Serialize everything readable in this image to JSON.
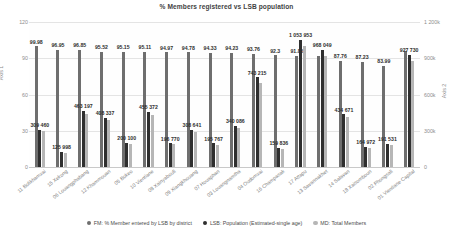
{
  "chart": {
    "title": "% Members registered vs LSB population",
    "y1_title": "Axis 1",
    "y2_title": "Axis 2",
    "y1_ticks": [
      "0",
      "30",
      "60",
      "90",
      "120"
    ],
    "y2_ticks": [
      "0",
      "300k",
      "600k",
      "900k",
      "1 200k"
    ]
  },
  "legend": {
    "items": [
      {
        "key": "fm",
        "label": "FM: % Member entered by LSB by district",
        "color": "#6e6e6e"
      },
      {
        "key": "lsb",
        "label": "LSB: Population (Estimated-single age)",
        "color": "#2f2f2f"
      },
      {
        "key": "md",
        "label": "MD: Total Members",
        "color": "#b6b6b6"
      }
    ]
  },
  "chart_data": {
    "type": "bar",
    "title": "% Members registered vs LSB population",
    "xlabel": "",
    "ylabel": "Axis 1",
    "y2label": "Axis 2",
    "ylim": [
      0,
      120
    ],
    "y2lim": [
      0,
      1200000
    ],
    "grid": true,
    "legend_position": "bottom",
    "categories": [
      "11 Bolikhamxai",
      "15 Xekong",
      "06 Louangphabang",
      "12 Khammouan",
      "05 Bokeo",
      "10 Vientiane",
      "08 Xainyabouli",
      "09 Xiangkhouang",
      "07 Houaphan",
      "03 Louangnamtha",
      "04 Oudomxai",
      "16 Champasak",
      "17 Attapu",
      "13 Savannakhet",
      "14 Salavan",
      "18 Xaisomboun",
      "02 Phongsali",
      "01 Vientiane Capital"
    ],
    "series": [
      {
        "name": "FM: % Member entered by LSB by district",
        "axis": "y1",
        "color": "#6e6e6e",
        "values": [
          99.98,
          96.95,
          96.85,
          95.52,
          95.15,
          95.11,
          94.97,
          94.78,
          94.33,
          94.23,
          93.76,
          92.3,
          91.85,
          91.6,
          87.76,
          87.23,
          83.99,
          96.0
        ],
        "labels": [
          "99.98",
          "96.95",
          "96.85",
          "95.52",
          "95.15",
          "95.11",
          "94.97",
          "94.78",
          "94.33",
          "94.23",
          "93.76",
          "92.3",
          "91.85",
          "",
          "87.76",
          "87.23",
          "83.99",
          ""
        ]
      },
      {
        "name": "LSB: Population (Estimated-single age)",
        "axis": "y2",
        "color": "#2f2f2f",
        "values": [
          309460,
          125998,
          463197,
          408337,
          200100,
          455372,
          196770,
          308641,
          195767,
          340086,
          743215,
          159836,
          1053953,
          968049,
          434671,
          164972,
          191531,
          927730
        ],
        "labels": [
          "309 460",
          "125 998",
          "463 197",
          "408 337",
          "200 100",
          "455 372",
          "196 770",
          "308 641",
          "195 767",
          "340 086",
          "743 215",
          "159 836",
          "1 053 953",
          "968 049",
          "434 671",
          "164 972",
          "191 531",
          "927 730"
        ]
      },
      {
        "name": "MD: Total Members",
        "axis": "y2",
        "color": "#b6b6b6",
        "values": [
          295000,
          119000,
          440000,
          386000,
          190000,
          433000,
          188000,
          293000,
          186000,
          321000,
          695000,
          150000,
          1000000,
          918000,
          411000,
          156000,
          181000,
          876000
        ]
      }
    ]
  }
}
